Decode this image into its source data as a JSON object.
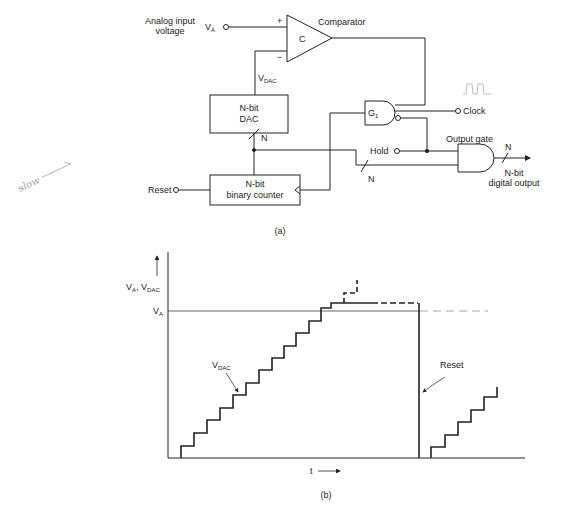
{
  "figure_a": {
    "caption": "(a)",
    "labels": {
      "analog_input_line1": "Analog input",
      "analog_input_line2": "voltage",
      "va": "V",
      "va_sub": "A",
      "comparator": "Comparator",
      "comparator_symbol": "C",
      "plus": "+",
      "minus": "−",
      "vdac": "V",
      "vdac_sub": "DAC",
      "dac_line1": "N-bit",
      "dac_line2": "DAC",
      "counter_line1": "N-bit",
      "counter_line2": "binary counter",
      "bus_n1": "N",
      "bus_n2": "N",
      "bus_n3": "N",
      "reset": "Reset",
      "gate_g": "G",
      "gate_g_sub": "1",
      "clock": "Clock",
      "hold": "Hold",
      "output_gate": "Output gate",
      "output_line1": "N-bit",
      "output_line2": "digital output",
      "handwritten_note": "slow"
    }
  },
  "figure_b": {
    "caption": "(b)",
    "labels": {
      "y_axis": "V",
      "y_axis_sub1": "A",
      "y_axis_sep": ", V",
      "y_axis_sub2": "DAC",
      "va_level": "V",
      "va_level_sub": "A",
      "vdac_curve": "V",
      "vdac_curve_sub": "DAC",
      "reset": "Reset",
      "x_axis": "t"
    }
  },
  "colors": {
    "ink": "#222222",
    "faint": "#9a9a9a",
    "background": "#ffffff"
  }
}
